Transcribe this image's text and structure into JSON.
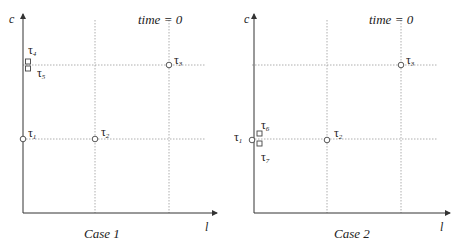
{
  "panels": [
    {
      "id": "case1",
      "caption": "Case 1",
      "time_label": "time = 0",
      "y_axis_label": "c",
      "x_axis_label": "l",
      "tasks": [
        {
          "name": "τ",
          "sub": "1",
          "marker": "circle"
        },
        {
          "name": "τ",
          "sub": "2",
          "marker": "circle"
        },
        {
          "name": "τ",
          "sub": "3",
          "marker": "circle"
        },
        {
          "name": "τ",
          "sub": "4",
          "marker": "square"
        },
        {
          "name": "τ",
          "sub": "5",
          "marker": "square"
        }
      ]
    },
    {
      "id": "case2",
      "caption": "Case 2",
      "time_label": "time = 0",
      "y_axis_label": "c",
      "x_axis_label": "l",
      "tasks": [
        {
          "name": "τ",
          "sub": "1",
          "marker": "circle"
        },
        {
          "name": "τ",
          "sub": "2",
          "marker": "circle"
        },
        {
          "name": "τ",
          "sub": "3",
          "marker": "circle"
        },
        {
          "name": "τ",
          "sub": "6",
          "marker": "square"
        },
        {
          "name": "τ",
          "sub": "7",
          "marker": "square"
        }
      ]
    }
  ],
  "colors": {
    "axis": "#333333",
    "grid": "#9a9a9a",
    "marker": "#444444"
  }
}
